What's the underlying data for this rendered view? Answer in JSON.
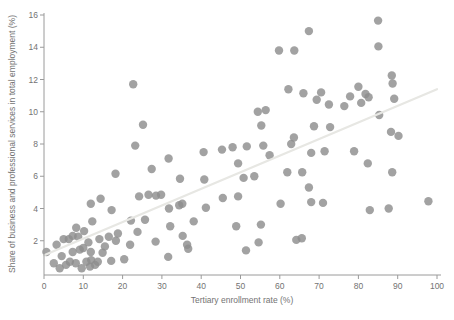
{
  "chart_data": {
    "type": "scatter",
    "title": "",
    "xlabel": "Tertiary enrollment rate (%)",
    "ylabel": "Share of business and professional services in total employment (%)",
    "xlim": [
      0,
      100
    ],
    "ylim": [
      0,
      16
    ],
    "x_ticks": [
      0,
      10,
      20,
      30,
      40,
      50,
      60,
      70,
      80,
      90,
      100
    ],
    "y_ticks": [
      2,
      4,
      6,
      8,
      10,
      12,
      14,
      16
    ],
    "grid": false,
    "legend": null,
    "point_color": "#8e8e8e",
    "point_radius": 4.2,
    "point_opacity": 0.82,
    "axis_color": "#9a9a9a",
    "label_color": "#737373",
    "trendline": {
      "x1": 0,
      "y1": 1.1,
      "x2": 100,
      "y2": 11.4,
      "color": "#e7e7e3",
      "width": 2.2
    },
    "points": [
      [
        0.6,
        1.3
      ],
      [
        3.2,
        1.75
      ],
      [
        2.5,
        0.6
      ],
      [
        4.0,
        0.3
      ],
      [
        4.5,
        1.05
      ],
      [
        5.0,
        2.1
      ],
      [
        5.6,
        0.5
      ],
      [
        6.3,
        2.1
      ],
      [
        6.6,
        0.7
      ],
      [
        7.3,
        1.3
      ],
      [
        7.3,
        2.3
      ],
      [
        8.1,
        0.6
      ],
      [
        8.2,
        2.8
      ],
      [
        8.7,
        2.25
      ],
      [
        9.1,
        1.45
      ],
      [
        9.6,
        0.3
      ],
      [
        10.0,
        1.55
      ],
      [
        10.2,
        2.6
      ],
      [
        10.8,
        0.7
      ],
      [
        11.3,
        1.9
      ],
      [
        11.7,
        0.4
      ],
      [
        11.9,
        1.3
      ],
      [
        12.3,
        3.2
      ],
      [
        12.0,
        0.8
      ],
      [
        13.0,
        0.5
      ],
      [
        13.7,
        0.7
      ],
      [
        14.1,
        2.1
      ],
      [
        14.9,
        1.25
      ],
      [
        15.5,
        1.65
      ],
      [
        16.5,
        2.25
      ],
      [
        17.1,
        0.75
      ],
      [
        18.3,
        2.0
      ],
      [
        18.8,
        2.45
      ],
      [
        20.4,
        0.85
      ],
      [
        21.9,
        1.75
      ],
      [
        23.8,
        2.55
      ],
      [
        22.1,
        3.25
      ],
      [
        25.7,
        3.3
      ],
      [
        11.9,
        4.3
      ],
      [
        14.4,
        4.6
      ],
      [
        17.2,
        3.9
      ],
      [
        18.2,
        6.15
      ],
      [
        24.2,
        4.75
      ],
      [
        26.6,
        4.85
      ],
      [
        28.5,
        4.8
      ],
      [
        29.8,
        4.85
      ],
      [
        31.8,
        4.0
      ],
      [
        34.4,
        4.2
      ],
      [
        35.2,
        4.3
      ],
      [
        34.6,
        5.85
      ],
      [
        40.8,
        5.8
      ],
      [
        41.2,
        4.05
      ],
      [
        45.5,
        4.65
      ],
      [
        49.4,
        4.75
      ],
      [
        50.8,
        5.9
      ],
      [
        53.5,
        6.0
      ],
      [
        28.4,
        1.95
      ],
      [
        31.6,
        1.0
      ],
      [
        32.1,
        2.9
      ],
      [
        35.3,
        2.3
      ],
      [
        36.4,
        1.75
      ],
      [
        36.7,
        1.5
      ],
      [
        38.1,
        3.2
      ],
      [
        48.9,
        2.9
      ],
      [
        51.4,
        1.4
      ],
      [
        54.6,
        1.9
      ],
      [
        55.2,
        3.0
      ],
      [
        64.2,
        2.05
      ],
      [
        65.6,
        2.15
      ],
      [
        22.7,
        11.7
      ],
      [
        25.2,
        9.2
      ],
      [
        23.2,
        7.9
      ],
      [
        27.4,
        6.45
      ],
      [
        31.7,
        7.1
      ],
      [
        40.6,
        7.5
      ],
      [
        45.3,
        7.65
      ],
      [
        48.0,
        7.8
      ],
      [
        49.4,
        6.8
      ],
      [
        51.6,
        7.85
      ],
      [
        55.8,
        7.9
      ],
      [
        57.4,
        7.3
      ],
      [
        54.4,
        10.0
      ],
      [
        56.4,
        10.1
      ],
      [
        55.3,
        9.15
      ],
      [
        59.8,
        13.8
      ],
      [
        63.7,
        13.8
      ],
      [
        62.2,
        11.4
      ],
      [
        66.0,
        11.15
      ],
      [
        67.4,
        15.0
      ],
      [
        62.9,
        8.0
      ],
      [
        63.6,
        8.4
      ],
      [
        61.9,
        6.25
      ],
      [
        65.7,
        6.25
      ],
      [
        60.2,
        4.3
      ],
      [
        67.4,
        5.3
      ],
      [
        68.0,
        7.45
      ],
      [
        68.0,
        4.4
      ],
      [
        68.7,
        9.1
      ],
      [
        69.4,
        10.75
      ],
      [
        70.5,
        11.2
      ],
      [
        71.0,
        4.35
      ],
      [
        71.4,
        7.55
      ],
      [
        72.5,
        10.45
      ],
      [
        72.8,
        9.05
      ],
      [
        76.4,
        10.35
      ],
      [
        77.9,
        10.95
      ],
      [
        78.9,
        7.55
      ],
      [
        80.0,
        11.55
      ],
      [
        80.7,
        10.55
      ],
      [
        81.8,
        11.1
      ],
      [
        82.6,
        10.9
      ],
      [
        82.4,
        6.8
      ],
      [
        82.9,
        3.9
      ],
      [
        85.0,
        15.65
      ],
      [
        85.1,
        14.05
      ],
      [
        85.3,
        9.8
      ],
      [
        87.7,
        4.0
      ],
      [
        88.5,
        12.25
      ],
      [
        88.7,
        11.75
      ],
      [
        88.6,
        6.25
      ],
      [
        88.3,
        8.75
      ],
      [
        89.1,
        10.8
      ],
      [
        90.2,
        8.5
      ],
      [
        97.8,
        4.45
      ]
    ]
  }
}
